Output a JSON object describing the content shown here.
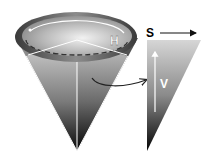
{
  "diagram": {
    "labels": {
      "hue": "H",
      "saturation": "S",
      "value": "V"
    },
    "colors": {
      "background": "#ffffff",
      "cone_light": "#d8d8d8",
      "cone_dark": "#111111",
      "rim_dark": "#4a4a4a",
      "line": "#ffffff",
      "arrow": "#222222"
    }
  }
}
